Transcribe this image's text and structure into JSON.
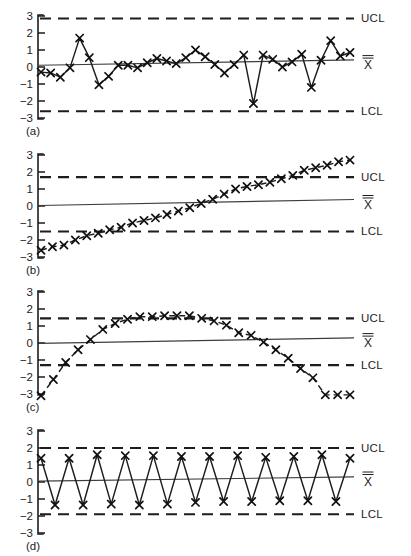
{
  "figure": {
    "y_axis": {
      "ticks": [
        3,
        2,
        1,
        0,
        -1,
        -2,
        -3
      ],
      "tick_labels": [
        "3",
        "2",
        "1",
        "0",
        "−1",
        "−2",
        "−3"
      ],
      "min": -3.4,
      "max": 3.4
    },
    "labels": {
      "ucl": "UCL",
      "lcl": "LCL",
      "centerline": "X",
      "centerline_overbar": "=",
      "centerline_full": "X̿"
    },
    "colors": {
      "ink": "#1d1d1d",
      "marker": "#111111",
      "centerline": "#3d3d3d",
      "background": "#ffffff"
    },
    "panel_tags": [
      "(a)",
      "(b)",
      "(c)",
      "(d)"
    ]
  },
  "chart_data": [
    {
      "type": "line",
      "title": "(a)",
      "panel": "a",
      "xlabel": "",
      "ylabel": "",
      "ylim": [
        -3.4,
        3.4
      ],
      "grid": false,
      "legend": "right",
      "marker": "x",
      "line_style": "solid",
      "ucl": 2.85,
      "lcl": -2.6,
      "centerline_start": 0.1,
      "centerline_end": 0.42,
      "annotations": [
        "UCL",
        "X̿",
        "LCL"
      ],
      "x": [
        1,
        2,
        3,
        4,
        5,
        6,
        7,
        8,
        9,
        10,
        11,
        12,
        13,
        14,
        15,
        16,
        17,
        18,
        19,
        20,
        21,
        22,
        23,
        24,
        25,
        26,
        27,
        28,
        29,
        30,
        31,
        32,
        33
      ],
      "values": [
        -0.3,
        -0.35,
        -0.6,
        -0.05,
        1.7,
        0.55,
        -1.05,
        -0.55,
        0.1,
        0.1,
        -0.05,
        0.25,
        0.5,
        0.35,
        0.2,
        0.55,
        1.0,
        0.6,
        0.15,
        -0.35,
        0.15,
        0.7,
        -2.15,
        0.7,
        0.45,
        0.0,
        0.3,
        0.75,
        -1.2,
        0.4,
        1.55,
        0.65,
        0.85
      ]
    },
    {
      "type": "line",
      "title": "(b)",
      "panel": "b",
      "xlabel": "",
      "ylabel": "",
      "ylim": [
        -3.4,
        3.4
      ],
      "grid": false,
      "legend": "right",
      "marker": "x",
      "line_style": "dashed",
      "ucl": 1.7,
      "lcl": -1.5,
      "centerline_start": 0.03,
      "centerline_end": 0.38,
      "annotations": [
        "UCL",
        "X̿",
        "LCL"
      ],
      "x": [
        1,
        2,
        3,
        4,
        5,
        6,
        7,
        8,
        9,
        10,
        11,
        12,
        13,
        14,
        15,
        16,
        17,
        18,
        19,
        20,
        21,
        22,
        23,
        24,
        25,
        26,
        27,
        28
      ],
      "values": [
        -2.6,
        -2.4,
        -2.3,
        -2.0,
        -1.75,
        -1.6,
        -1.4,
        -1.25,
        -1.0,
        -0.85,
        -0.7,
        -0.5,
        -0.3,
        -0.1,
        0.15,
        0.4,
        0.7,
        1.0,
        1.15,
        1.25,
        1.4,
        1.6,
        1.8,
        2.1,
        2.25,
        2.4,
        2.6,
        2.7
      ]
    },
    {
      "type": "line",
      "title": "(c)",
      "panel": "c",
      "xlabel": "",
      "ylabel": "",
      "ylim": [
        -3.4,
        3.4
      ],
      "grid": false,
      "legend": "right",
      "marker": "x",
      "line_style": "dashed",
      "ucl": 1.45,
      "lcl": -1.3,
      "centerline_start": -0.02,
      "centerline_end": 0.3,
      "annotations": [
        "UCL",
        "X̿",
        "LCL"
      ],
      "x": [
        1,
        2,
        3,
        4,
        5,
        6,
        7,
        8,
        9,
        10,
        11,
        12,
        13,
        14,
        15,
        16,
        17,
        18,
        19,
        20,
        21,
        22,
        23,
        24,
        25,
        26
      ],
      "values": [
        -3.1,
        -2.15,
        -1.15,
        -0.4,
        0.2,
        0.8,
        1.15,
        1.4,
        1.55,
        1.55,
        1.6,
        1.6,
        1.6,
        1.45,
        1.3,
        1.05,
        0.6,
        0.45,
        0.05,
        -0.4,
        -0.9,
        -1.5,
        -2.05,
        -3.05,
        -3.05,
        -3.05
      ]
    },
    {
      "type": "line",
      "title": "(d)",
      "panel": "d",
      "xlabel": "",
      "ylabel": "",
      "ylim": [
        -3.4,
        3.4
      ],
      "grid": false,
      "legend": "right",
      "marker": "x",
      "line_style": "solid",
      "ucl": 2.0,
      "lcl": -1.9,
      "centerline_start": 0.05,
      "centerline_end": 0.3,
      "annotations": [
        "UCL",
        "X̿",
        "LCL"
      ],
      "x": [
        1,
        2,
        3,
        4,
        5,
        6,
        7,
        8,
        9,
        10,
        11,
        12,
        13,
        14,
        15,
        16,
        17,
        18,
        19,
        20,
        21,
        22,
        23
      ],
      "values": [
        1.4,
        -1.35,
        1.4,
        -1.35,
        1.6,
        -1.3,
        1.55,
        -1.35,
        1.55,
        -1.3,
        1.5,
        -1.2,
        1.5,
        -1.15,
        1.55,
        -1.15,
        1.45,
        -1.1,
        1.5,
        -1.1,
        1.6,
        -1.15,
        1.4
      ]
    }
  ]
}
